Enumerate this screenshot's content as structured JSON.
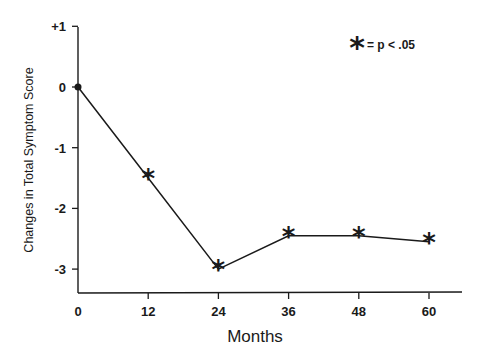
{
  "chart_data": {
    "type": "line",
    "title": "",
    "xlabel": "Months",
    "ylabel": "Changes in Total Symptom Score",
    "x": [
      0,
      12,
      24,
      36,
      48,
      60
    ],
    "series": [
      {
        "name": "Total Symptom Score change",
        "values": [
          0,
          -1.5,
          -3.0,
          -2.45,
          -2.45,
          -2.55
        ],
        "markers": [
          "dot",
          "star",
          "star",
          "star",
          "star",
          "star"
        ]
      }
    ],
    "xticks": [
      "0",
      "12",
      "24",
      "36",
      "48",
      "60"
    ],
    "xtick_values": [
      0,
      12,
      24,
      36,
      48,
      60
    ],
    "yticks": [
      "+1",
      "0",
      "-1",
      "-2",
      "-3"
    ],
    "ytick_values": [
      1,
      0,
      -1,
      -2,
      -3
    ],
    "xlim": [
      0,
      66
    ],
    "ylim": [
      -3.4,
      1
    ],
    "grid": false,
    "legend": {
      "placement": "top-right",
      "symbol": "*",
      "text": "= p < .05"
    },
    "line_color": "#1a1a1a"
  }
}
